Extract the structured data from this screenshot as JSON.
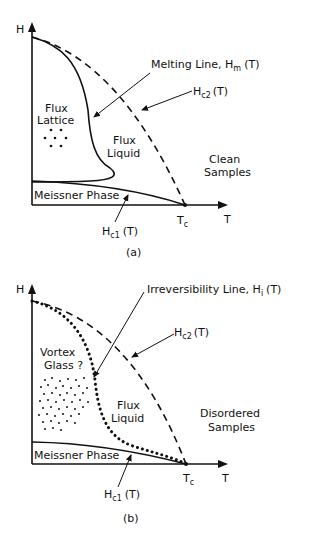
{
  "panel_a": {
    "caption": "(a)",
    "axis_y": "H",
    "axis_x": "T",
    "tc_label": "T",
    "tc_sub": "c",
    "regions": {
      "lattice_1": "Flux",
      "lattice_2": "Lattice",
      "liquid_1": "Flux",
      "liquid_2": "Liquid",
      "meissner": "Meissner Phase",
      "sample_1": "Clean",
      "sample_2": "Samples"
    },
    "labels": {
      "melting": "Melting  Line,  H",
      "melting_sub": "m",
      "melting_tail": "(T)",
      "hc2": "H",
      "hc2_sub": "c2",
      "hc2_tail": "(T)",
      "hc1": "H",
      "hc1_sub": "c1",
      "hc1_tail": "(T)"
    }
  },
  "panel_b": {
    "caption": "(b)",
    "axis_y": "H",
    "axis_x": "T",
    "tc_label": "T",
    "tc_sub": "c",
    "regions": {
      "glass_1": "Vortex",
      "glass_2": "Glass ?",
      "liquid_1": "Flux",
      "liquid_2": "Liquid",
      "meissner": "Meissner Phase",
      "sample_1": "Disordered",
      "sample_2": "Samples"
    },
    "labels": {
      "irrev": "Irreversibility  Line,  H",
      "irrev_sub": "i",
      "irrev_tail": "(T)",
      "hc2": "H",
      "hc2_sub": "c2",
      "hc2_tail": "(T)",
      "hc1": "H",
      "hc1_sub": "c1",
      "hc1_tail": "(T)"
    }
  }
}
